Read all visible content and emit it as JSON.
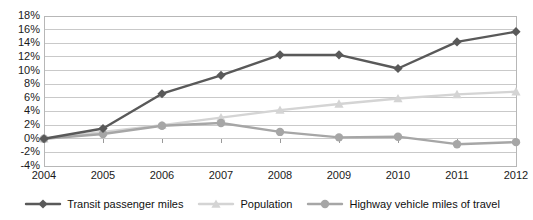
{
  "chart_data": {
    "type": "line",
    "title": "",
    "xlabel": "",
    "ylabel": "",
    "categories": [
      "2004",
      "2005",
      "2006",
      "2007",
      "2008",
      "2009",
      "2010",
      "2011",
      "2012"
    ],
    "x": [
      2004,
      2005,
      2006,
      2007,
      2008,
      2009,
      2010,
      2011,
      2012
    ],
    "ylim": [
      -4,
      18
    ],
    "ytick_values": [
      18,
      16,
      14,
      12,
      10,
      8,
      6,
      4,
      2,
      0,
      -2,
      -4
    ],
    "ytick_labels": [
      "18%",
      "16%",
      "14%",
      "12%",
      "10%",
      "8%",
      "6%",
      "4%",
      "2%",
      "0%",
      "-2%",
      "-4%"
    ],
    "grid": true,
    "grid_axis": "y",
    "legend_position": "bottom",
    "value_suffix": "%",
    "series": [
      {
        "name": "Transit passenger miles",
        "color": "#595959",
        "marker": "diamond",
        "values": [
          0.0,
          1.5,
          6.6,
          9.3,
          12.3,
          12.3,
          10.3,
          14.2,
          15.7
        ]
      },
      {
        "name": "Population",
        "color": "#d4d4d4",
        "marker": "triangle",
        "values": [
          0.0,
          1.0,
          2.0,
          3.1,
          4.2,
          5.1,
          5.9,
          6.5,
          6.9
        ]
      },
      {
        "name": "Highway vehicle miles of travel",
        "color": "#a6a6a6",
        "marker": "circle",
        "values": [
          0.0,
          0.7,
          1.9,
          2.3,
          1.0,
          0.2,
          0.3,
          -0.8,
          -0.5
        ]
      }
    ]
  },
  "style": {
    "plot_border_color": "#b7b7b7",
    "gridline_color": "#c9c9c9",
    "background": "#ffffff",
    "text_color": "#1a1a1a"
  }
}
